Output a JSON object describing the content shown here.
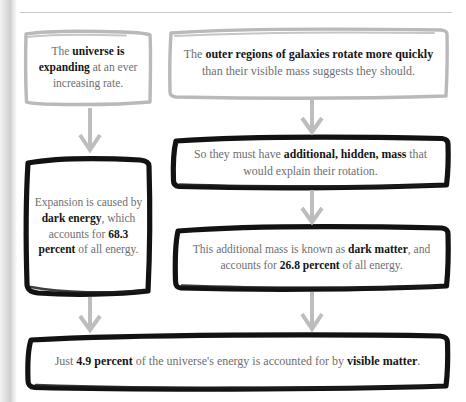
{
  "page": {
    "background_color": "#ffffff",
    "body_text_color": "#6e6e72",
    "emphasis_text_color": "#151515",
    "gray_border_color": "#b9b9b9",
    "dark_border_color": "#121212",
    "arrow_color": "#bdbdbd"
  },
  "boxes": [
    {
      "id": "universe-expanding",
      "name": "box-universe-expanding",
      "border_style": "gray-sketch",
      "plain_text": "The universe is expanding at an ever increasing rate.",
      "segments": [
        {
          "text": "The ",
          "bold": false
        },
        {
          "text": "universe",
          "bold": true
        },
        {
          "text": " ",
          "bold": false
        },
        {
          "text": "is expanding",
          "bold": true
        },
        {
          "text": " at an ever increasing rate.",
          "bold": false
        }
      ]
    },
    {
      "id": "outer-regions",
      "name": "box-outer-regions-rotate",
      "border_style": "gray-sketch",
      "plain_text": "The outer regions of galaxies rotate more quickly than their visible mass suggests they should.",
      "segments": [
        {
          "text": "The ",
          "bold": false
        },
        {
          "text": "outer regions of galaxies rotate more quickly",
          "bold": true
        },
        {
          "text": " than their visible mass suggests they should.",
          "bold": false
        }
      ]
    },
    {
      "id": "hidden-mass",
      "name": "box-additional-hidden-mass",
      "border_style": "dark-sketch",
      "plain_text": "So they must have additional, hidden, mass that would explain their rotation.",
      "segments": [
        {
          "text": "So they must have ",
          "bold": false
        },
        {
          "text": "additional, hidden, mass",
          "bold": true
        },
        {
          "text": " that would explain their rotation.",
          "bold": false
        }
      ]
    },
    {
      "id": "dark-energy",
      "name": "box-dark-energy",
      "border_style": "dark-sketch",
      "plain_text": "Expansion is caused by dark energy, which accounts for 68.3 percent of all energy.",
      "segments": [
        {
          "text": "Expansion is caused by ",
          "bold": false
        },
        {
          "text": "dark energy",
          "bold": true
        },
        {
          "text": ", which accounts for ",
          "bold": false
        },
        {
          "text": "68.3 percent",
          "bold": true
        },
        {
          "text": " of all energy.",
          "bold": false
        }
      ]
    },
    {
      "id": "dark-matter",
      "name": "box-dark-matter",
      "border_style": "dark-sketch",
      "plain_text": "This additional mass is known as dark matter, and accounts for 26.8 percent of all energy.",
      "segments": [
        {
          "text": "This additional mass is known as ",
          "bold": false
        },
        {
          "text": "dark matter",
          "bold": true
        },
        {
          "text": ", and accounts for ",
          "bold": false
        },
        {
          "text": "26.8 percent",
          "bold": true
        },
        {
          "text": " of all energy.",
          "bold": false
        }
      ]
    },
    {
      "id": "visible-matter",
      "name": "box-visible-matter",
      "border_style": "dark-sketch",
      "plain_text": "Just 4.9 percent of the universe's energy is accounted for by visible matter.",
      "segments": [
        {
          "text": "Just ",
          "bold": false
        },
        {
          "text": "4.9 percent",
          "bold": true
        },
        {
          "text": " of the universe's energy is accounted for by ",
          "bold": false
        },
        {
          "text": "visible matter",
          "bold": true
        },
        {
          "text": ".",
          "bold": false
        }
      ]
    }
  ],
  "arrows": [
    {
      "id": "a1",
      "name": "arrow-expanding-to-dark-energy",
      "from": "universe-expanding",
      "to": "dark-energy"
    },
    {
      "id": "a2",
      "name": "arrow-outer-regions-to-hidden-mass",
      "from": "outer-regions",
      "to": "hidden-mass"
    },
    {
      "id": "a3",
      "name": "arrow-hidden-mass-to-dark-matter",
      "from": "hidden-mass",
      "to": "dark-matter"
    },
    {
      "id": "a4",
      "name": "arrow-dark-energy-to-visible-matter",
      "from": "dark-energy",
      "to": "visible-matter"
    },
    {
      "id": "a5",
      "name": "arrow-dark-matter-to-visible-matter",
      "from": "dark-matter",
      "to": "visible-matter"
    }
  ],
  "figures": {
    "percentages": {
      "dark_energy": "68.3 percent",
      "dark_matter": "26.8 percent",
      "visible_matter": "4.9 percent"
    }
  }
}
